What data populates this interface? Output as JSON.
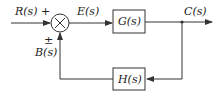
{
  "diagram": {
    "type": "feedback-control-block-diagram",
    "input_label": "R(s)",
    "error_label": "E(s)",
    "feedback_label": "B(s)",
    "output_label": "C(s)",
    "input_sign": "+",
    "feedback_sign": "±",
    "summing_symbol": "×",
    "forward_block": "G(s)",
    "feedback_block": "H(s)",
    "line_color": "#333333"
  }
}
